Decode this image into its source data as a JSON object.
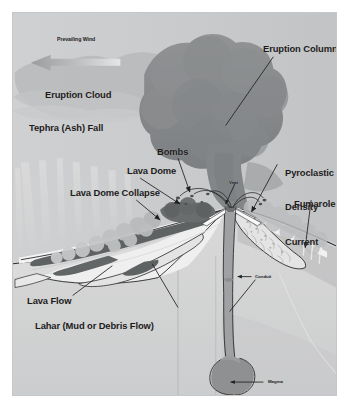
{
  "figure": {
    "frame_background": "#cfd0d1",
    "page_background": "#ffffff"
  },
  "palette": {
    "sky": "#cfd0d1",
    "ash_cloud": "#b9babb",
    "eruption_column": "#8a8d8f",
    "column_dark": "#7e8183",
    "ground_light": "#d7d7d7",
    "ground_mid": "#c3c4c5",
    "ground_dark": "#b0b1b2",
    "flank_white": "#f2f2f2",
    "deposit_fill": "#e6e6e6",
    "lava_dark": "#5f6263",
    "conduit": "#9a9c9d",
    "magma": "#8e9092",
    "line": "#1f1f1f",
    "label_text": "#1b1b1b"
  },
  "labels": {
    "prevailing_wind": "Prevailing Wind",
    "eruption_cloud": "Eruption Cloud",
    "tephra_ash_fall": "Tephra (Ash) Fall",
    "eruption_column": "Eruption Column",
    "bombs": "Bombs",
    "lava_dome": "Lava Dome",
    "lava_dome_collapse": "Lava Dome Collapse",
    "pyroclastic_line1": "Pyroclastic",
    "pyroclastic_line2": "Density",
    "pyroclastic_line3": "Current",
    "fumaroles": "Fumaroles",
    "vent": "Vent",
    "conduit": "Conduit",
    "magma": "Magma",
    "lava_flow": "Lava Flow",
    "lahar": "Lahar (Mud or Debris Flow)"
  },
  "annotations": [
    {
      "name": "prevailing-wind",
      "text": "Prevailing Wind",
      "marker": "left-arrow"
    },
    {
      "name": "eruption-cloud",
      "text": "Eruption Cloud",
      "marker": "none"
    },
    {
      "name": "tephra-ash-fall",
      "text": "Tephra (Ash) Fall",
      "marker": "none"
    },
    {
      "name": "eruption-column",
      "text": "Eruption Column",
      "marker": "leader-line"
    },
    {
      "name": "bombs",
      "text": "Bombs",
      "marker": "leader-arrow"
    },
    {
      "name": "lava-dome",
      "text": "Lava Dome",
      "marker": "leader-arrow"
    },
    {
      "name": "lava-dome-collapse",
      "text": "Lava Dome Collapse",
      "marker": "leader-arrow"
    },
    {
      "name": "pyroclastic-density-current",
      "text": "Pyroclastic Density Current",
      "marker": "leader-arrow"
    },
    {
      "name": "fumaroles",
      "text": "Fumaroles",
      "marker": "leader-arrow"
    },
    {
      "name": "vent",
      "text": "Vent",
      "marker": "leader-arrow"
    },
    {
      "name": "conduit",
      "text": "Conduit",
      "marker": "left-arrow"
    },
    {
      "name": "magma",
      "text": "Magma",
      "marker": "left-arrow"
    },
    {
      "name": "lava-flow",
      "text": "Lava Flow",
      "marker": "leader-line"
    },
    {
      "name": "lahar",
      "text": "Lahar (Mud or Debris Flow)",
      "marker": "leader-line"
    }
  ]
}
